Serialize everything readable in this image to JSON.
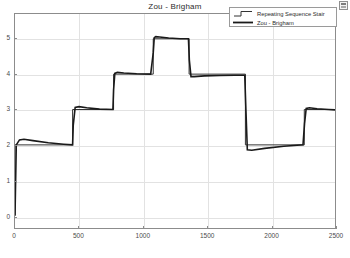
{
  "window": {
    "corner_icon": "maximize-restore-icon"
  },
  "chart_data": {
    "type": "line",
    "title": "Zou - Brigham",
    "xlabel": "",
    "ylabel": "",
    "xlim": [
      0,
      2500
    ],
    "ylim": [
      -0.35,
      5.7
    ],
    "xticks": [
      0,
      500,
      1000,
      1500,
      2000,
      2500
    ],
    "xticklabels": [
      "0",
      "500",
      "1000",
      "1500",
      "2000",
      "2500"
    ],
    "yticks": [
      0,
      1,
      2,
      3,
      4,
      5
    ],
    "yticklabels": [
      "0",
      "1",
      "2",
      "3",
      "4",
      "5"
    ],
    "grid": true,
    "legend_position": "top-right",
    "background": "#ffffff",
    "axis_color": "#8c8c8c",
    "grid_color": "#e2e2e2",
    "series": [
      {
        "name": "Repeating Sequence Stair",
        "style": "stair",
        "color": "#333333",
        "linewidth": 1.0,
        "description": "Ideal staircase reference signal",
        "x": [
          0,
          0,
          450,
          450,
          770,
          770,
          1080,
          1080,
          1360,
          1360,
          1800,
          1800,
          2260,
          2260,
          2500
        ],
        "y": [
          0,
          2,
          2,
          3,
          3,
          4,
          4,
          5,
          5,
          4,
          4,
          2,
          2,
          3,
          3
        ]
      },
      {
        "name": "Zou - Brigham",
        "style": "line",
        "color": "#1a1a1a",
        "linewidth": 1.6,
        "description": "System response with overshoot transient at each step",
        "x": [
          0,
          10,
          35,
          70,
          140,
          260,
          380,
          450,
          455,
          470,
          500,
          560,
          660,
          765,
          770,
          780,
          800,
          850,
          950,
          1060,
          1080,
          1088,
          1100,
          1130,
          1200,
          1290,
          1355,
          1362,
          1375,
          1400,
          1480,
          1600,
          1720,
          1795,
          1802,
          1815,
          1850,
          1950,
          2100,
          2250,
          2262,
          2275,
          2300,
          2360,
          2450,
          2500
        ],
        "y": [
          0,
          2.0,
          2.14,
          2.16,
          2.12,
          2.06,
          2.02,
          2.0,
          2.55,
          3.06,
          3.08,
          3.05,
          3.01,
          3.0,
          3.55,
          4.02,
          4.05,
          4.03,
          4.01,
          4.0,
          4.6,
          5.03,
          5.06,
          5.05,
          5.02,
          5.0,
          5.0,
          4.4,
          3.93,
          3.93,
          3.95,
          3.96,
          3.97,
          3.97,
          3.2,
          1.86,
          1.85,
          1.9,
          1.96,
          2.0,
          2.6,
          3.03,
          3.05,
          3.02,
          3.0,
          2.99
        ]
      }
    ],
    "step_levels": [
      {
        "t_start": 0,
        "t_end": 450,
        "level": 2,
        "overshoot_peak": 2.16
      },
      {
        "t_start": 450,
        "t_end": 770,
        "level": 3,
        "overshoot_peak": 3.08
      },
      {
        "t_start": 770,
        "t_end": 1080,
        "level": 4,
        "overshoot_peak": 4.05
      },
      {
        "t_start": 1080,
        "t_end": 1360,
        "level": 5,
        "overshoot_peak": 5.06
      },
      {
        "t_start": 1360,
        "t_end": 1800,
        "level": 4,
        "overshoot_peak": 3.93
      },
      {
        "t_start": 1800,
        "t_end": 2260,
        "level": 2,
        "overshoot_peak": 1.85
      },
      {
        "t_start": 2260,
        "t_end": 2500,
        "level": 3,
        "overshoot_peak": 3.05
      }
    ]
  },
  "legend": {
    "entries": [
      {
        "label": "Repeating Sequence Stair",
        "icon": "stair-step-icon"
      },
      {
        "label": "Zou - Brigham",
        "icon": "solid-line-icon"
      }
    ]
  }
}
